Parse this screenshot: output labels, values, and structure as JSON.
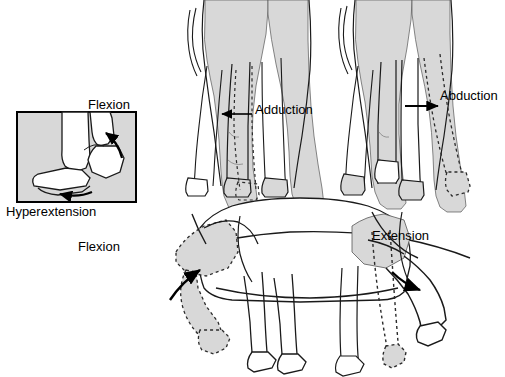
{
  "figure": {
    "background_color": "#ffffff",
    "width": 505,
    "height": 377,
    "line_color": "#000000",
    "fill_gray": "#d8d8d8",
    "fill_gray_dark": "#c4c4c4"
  },
  "labels": {
    "flexion_inset": "Flexion",
    "hyperextension": "Hyperextension",
    "adduction": "Adduction",
    "abduction": "Abduction",
    "flexion_lower": "Flexion",
    "extension": "Extension"
  },
  "panels": {
    "inset": {
      "name": "fetlock-joint-inset",
      "labels": [
        "Flexion",
        "Hyperextension"
      ],
      "border_color": "#000000",
      "fill": "#d8d8d8",
      "x": 17,
      "y": 112,
      "width": 119,
      "height": 90
    },
    "rear_adduction": {
      "name": "rear-view-adduction",
      "label": "Adduction",
      "arrow_direction": "left",
      "dashed_limb": "medial displaced hind limb"
    },
    "rear_abduction": {
      "name": "rear-view-abduction",
      "label": "Abduction",
      "arrow_direction": "right",
      "dashed_limb": "lateral displaced hind limb"
    },
    "lateral": {
      "name": "lateral-view-flexion-extension",
      "labels": [
        "Flexion",
        "Extension"
      ],
      "arrow_flexion": "curved, counter-clockwise",
      "arrow_extension": "curved, clockwise"
    }
  }
}
